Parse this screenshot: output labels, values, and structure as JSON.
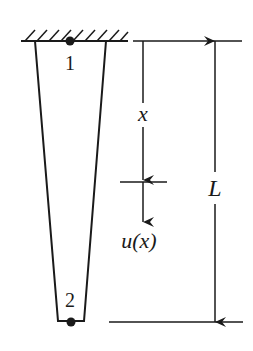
{
  "diagram": {
    "colors": {
      "stroke": "#1a1a1a",
      "background": "#ffffff"
    },
    "nodes": [
      {
        "id": "1",
        "label": "1"
      },
      {
        "id": "2",
        "label": "2"
      }
    ],
    "labels": {
      "position_variable": "x",
      "displacement": "u(x)",
      "length": "L"
    },
    "support": "fixed-wall-hatched"
  }
}
